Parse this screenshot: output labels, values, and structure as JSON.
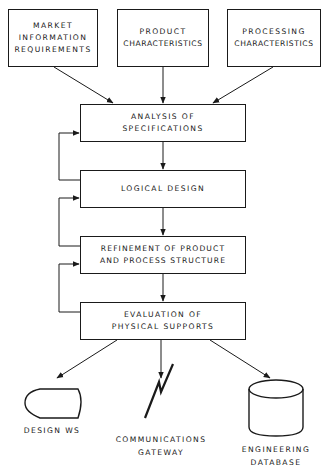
{
  "diagram": {
    "inputs": [
      {
        "lines": [
          "MARKET",
          "INFORMATION",
          "REQUIREMENTS"
        ]
      },
      {
        "lines": [
          "PRODUCT",
          "CHARACTERISTICS"
        ]
      },
      {
        "lines": [
          "PROCESSING",
          "CHARACTERISTICS"
        ]
      }
    ],
    "steps": [
      {
        "lines": [
          "ANALYSIS OF",
          "SPECIFICATIONS"
        ]
      },
      {
        "lines": [
          "LOGICAL DESIGN"
        ]
      },
      {
        "lines": [
          "REFINEMENT OF PRODUCT",
          "AND PROCESS STRUCTURE"
        ]
      },
      {
        "lines": [
          "EVALUATION OF",
          "PHYSICAL SUPPORTS"
        ]
      }
    ],
    "outputs": [
      {
        "icon": "design-workstation-icon",
        "lines": [
          "DESIGN WS"
        ]
      },
      {
        "icon": "lightning-link-icon",
        "lines": [
          "COMMUNICATIONS",
          "GATEWAY"
        ]
      },
      {
        "icon": "database-cylinder-icon",
        "lines": [
          "ENGINEERING",
          "DATABASE"
        ]
      }
    ],
    "line_color": "#1a1a1a"
  }
}
